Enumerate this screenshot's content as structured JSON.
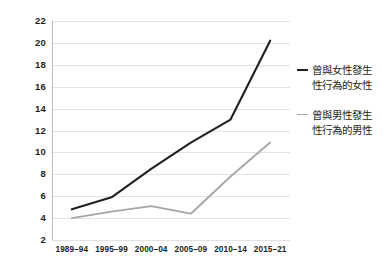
{
  "chart_data": {
    "type": "line",
    "title": "",
    "subtitle": "",
    "xlabel": "",
    "ylabel": "",
    "categories": [
      "1989–94",
      "1995–99",
      "2000–04",
      "2005–09",
      "2010–14",
      "2015–21"
    ],
    "ylim": [
      2,
      22
    ],
    "y_ticks": [
      22,
      20,
      18,
      16,
      14,
      12,
      10,
      8,
      6,
      4,
      2
    ],
    "grid": true,
    "legend_position": "right",
    "series": [
      {
        "name": "曾與女性發生\n性行為的女性",
        "color": "#231f20",
        "values": [
          4.8,
          5.9,
          8.5,
          10.9,
          13.0,
          20.2
        ]
      },
      {
        "name": "曾與男性發生\n性行為的男性",
        "color": "#a6a6a6",
        "values": [
          4.0,
          4.6,
          5.1,
          4.4,
          7.8,
          10.9
        ]
      }
    ],
    "colors": {
      "series_women": "#231f20",
      "series_men": "#a6a6a6",
      "gridline": "#e2e2e2",
      "axis": "#bdbdbd",
      "text": "#231f20",
      "background": "#ffffff"
    }
  },
  "y_axis": {
    "ticks": [
      {
        "label": "22",
        "value": 22
      },
      {
        "label": "20",
        "value": 20
      },
      {
        "label": "18",
        "value": 18
      },
      {
        "label": "16",
        "value": 16
      },
      {
        "label": "14",
        "value": 14
      },
      {
        "label": "12",
        "value": 12
      },
      {
        "label": "10",
        "value": 10
      },
      {
        "label": "8",
        "value": 8
      },
      {
        "label": "6",
        "value": 6
      },
      {
        "label": "4",
        "value": 4
      },
      {
        "label": "2",
        "value": 2
      }
    ]
  },
  "x_axis": {
    "ticks": [
      {
        "label": "1989–94"
      },
      {
        "label": "1995–99"
      },
      {
        "label": "2000–04"
      },
      {
        "label": "2005–09"
      },
      {
        "label": "2010–14"
      },
      {
        "label": "2015–21"
      }
    ]
  },
  "legend": {
    "entries": [
      {
        "label": "曾與女性發生\n性行為的女性",
        "color": "#231f20"
      },
      {
        "label": "曾與男性發生\n性行為的男性",
        "color": "#a6a6a6"
      }
    ]
  }
}
